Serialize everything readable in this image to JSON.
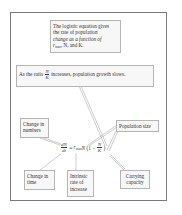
{
  "figure": {
    "type": "annotated-equation",
    "topic": "Logistic population growth equation",
    "colors": {
      "frame_border": "#7a7a7a",
      "box_border": "#b5b5b5",
      "box_fill": "#f7f7f7",
      "text": "#333333",
      "connector": "#9a9a9a"
    }
  },
  "callouts": {
    "summary": {
      "line1": "The logistic equation gives",
      "line2": "the rate of population",
      "line3": "change as a function of",
      "line4_prefix": "r",
      "line4_sub": "max",
      "line4_suffix": ", N, and K."
    },
    "ratio_note": {
      "prefix": "As the ratio ",
      "frac_num": "N",
      "frac_den": "K",
      "suffix": " increases, population growth slows."
    },
    "change_in_numbers": {
      "line1": "Change in",
      "line2": "numbers"
    },
    "population_size": {
      "line1": "Population size"
    },
    "change_in_time": {
      "line1": "Change in",
      "line2": "time"
    },
    "intrinsic_rate": {
      "line1": "Intrinsic",
      "line2": "rate of",
      "line3": "increase"
    },
    "carrying_capacity": {
      "line1": "Carrying",
      "line2": "capacity"
    }
  },
  "equation": {
    "lhs_num": "dN",
    "lhs_den": "dt",
    "equals": "=",
    "r": "r",
    "r_sub": "max",
    "n": "N",
    "open": " (1 − ",
    "rhs_frac_num": "N",
    "rhs_frac_den": "K",
    "close": " )"
  }
}
